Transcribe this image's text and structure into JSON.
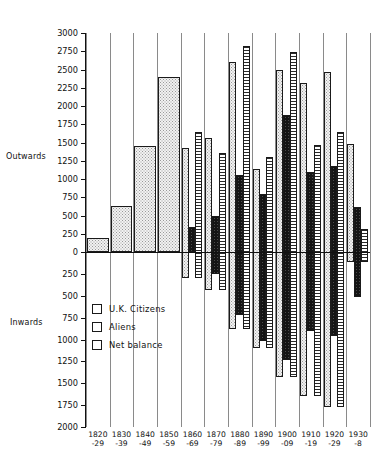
{
  "chart_data": {
    "type": "bar",
    "title": "",
    "xlabel": "",
    "ylabel": "",
    "axis_top_label": "Outwards",
    "axis_bottom_label": "Inwards",
    "grid": true,
    "legend_position": "inside-lower-left",
    "ylim": [
      -2000,
      3000
    ],
    "ytick_step": 250,
    "yticks_top": [
      "3000",
      "2750",
      "2500",
      "2250",
      "2000",
      "1750",
      "1500",
      "1250",
      "1000",
      "750",
      "500",
      "250",
      "0"
    ],
    "yticks_bottom": [
      "250",
      "500",
      "750",
      "1000",
      "1250",
      "1500",
      "1750",
      "2000"
    ],
    "categories": [
      "1820\n-29",
      "1830\n-39",
      "1840\n-49",
      "1850\n-59",
      "1860\n-69",
      "1870\n-79",
      "1880\n-89",
      "1890\n-99",
      "1900\n-09",
      "1910\n-19",
      "1920\n-29",
      "1930\n-8"
    ],
    "category_lines": [
      [
        "1820",
        "-29"
      ],
      [
        "1830",
        "-39"
      ],
      [
        "1840",
        "-49"
      ],
      [
        "1850",
        "-59"
      ],
      [
        "1860",
        "-69"
      ],
      [
        "1870",
        "-79"
      ],
      [
        "1880",
        "-89"
      ],
      [
        "1890",
        "-99"
      ],
      [
        "1900",
        "-09"
      ],
      [
        "1910",
        "-19"
      ],
      [
        "1920",
        "-29"
      ],
      [
        "1930",
        "-8"
      ]
    ],
    "series": [
      {
        "name": "U.K. Citizens",
        "key": "uk",
        "values": [
          190,
          630,
          1450,
          2400,
          1420,
          1560,
          2600,
          1140,
          2500,
          2320,
          2470,
          1480
        ]
      },
      {
        "name": "Aliens",
        "key": "al",
        "values": [
          0,
          0,
          0,
          0,
          340,
          490,
          1060,
          800,
          1880,
          1100,
          1180,
          620
        ]
      },
      {
        "name": "Net balance",
        "key": "nb",
        "values": [
          190,
          630,
          1450,
          2400,
          1640,
          1360,
          2820,
          1300,
          2740,
          1470,
          1640,
          320
        ]
      }
    ],
    "net_balance_negative": [
      null,
      null,
      null,
      null,
      -300,
      -430,
      -880,
      -1100,
      -1430,
      -1650,
      -1770,
      -120
    ],
    "uk_negative": [
      null,
      null,
      null,
      null,
      -300,
      -430,
      -880,
      -1100,
      -1430,
      -1650,
      -1770,
      -120
    ],
    "aliens_negative": [
      null,
      null,
      null,
      null,
      null,
      -250,
      -720,
      -1020,
      -1230,
      -900,
      -960,
      -520
    ],
    "annotations": []
  },
  "legend": {
    "items": [
      {
        "label": "U.K. Citizens",
        "key": "uk"
      },
      {
        "label": "Aliens",
        "key": "al"
      },
      {
        "label": "Net balance",
        "key": "nb"
      }
    ]
  },
  "colors": {
    "uk": "#f2f2f2",
    "aliens": "#141414",
    "net_balance": "#ffffff",
    "axis": "#111111",
    "grid": "#8a8a8a"
  }
}
